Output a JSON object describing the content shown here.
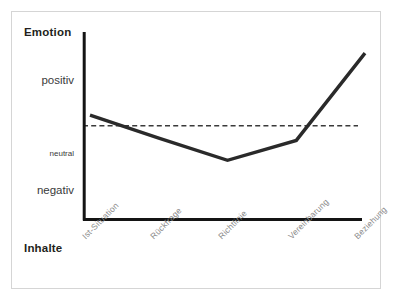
{
  "chart_data": {
    "type": "line",
    "title": "",
    "xlabel": "Inhalte",
    "ylabel": "Emotion",
    "categories": [
      "Ist-Situation",
      "Rückfrage",
      "Richtlinie",
      "Vereinbarung",
      "Beziehung"
    ],
    "y_tick_labels": [
      "positiv",
      "neutral",
      "negativ"
    ],
    "y_tick_values": [
      1,
      0,
      -1
    ],
    "ylim": [
      -1.6,
      1.6
    ],
    "grid": false,
    "legend": null,
    "reference_line": {
      "label": "neutral",
      "value": 0,
      "style": "dashed"
    },
    "series": [
      {
        "name": "Emotion",
        "values": [
          0.18,
          -0.21,
          -0.59,
          -0.25,
          1.24
        ],
        "color": "#2a2a2a"
      }
    ],
    "annotations": []
  },
  "axes": {
    "y_title": "Emotion",
    "x_title": "Inhalte",
    "y_labels": {
      "positiv": "positiv",
      "neutral": "neutral",
      "negativ": "negativ"
    }
  },
  "colors": {
    "line": "#2a2a2a",
    "axis": "#141414",
    "reference": "#3a3a3a",
    "frame": "#d5d5d5",
    "tick_text": "#8a8a8a",
    "title_text": "#231f20",
    "background": "#ffffff"
  }
}
